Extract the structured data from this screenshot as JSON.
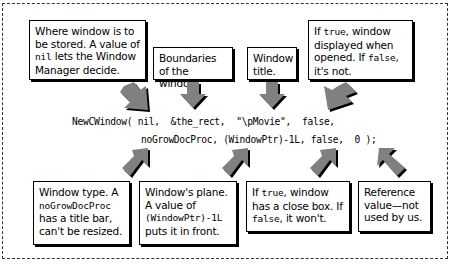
{
  "top_callouts": [
    {
      "id": "storage",
      "parts": [
        "Where window is to be stored. A value of ",
        "nil",
        " lets the Window Manager decide."
      ]
    },
    {
      "id": "bounds",
      "parts": [
        "Boundaries of the window."
      ]
    },
    {
      "id": "title",
      "parts": [
        "Window title."
      ]
    },
    {
      "id": "visible",
      "parts": [
        "If ",
        "true",
        ", window displayed when opened. If ",
        "false",
        ", it's not."
      ]
    }
  ],
  "code": {
    "line1": "NewCWindow( nil,  &the_rect,  \"\\pMovie\",  false,",
    "line2": "noGrowDocProc, (WindowPtr)-1L, false,  0 );"
  },
  "bottom_callouts": [
    {
      "id": "type",
      "parts": [
        "Window type. A ",
        "noGrowDocProc",
        " has a title bar, can't be resized."
      ]
    },
    {
      "id": "plane",
      "parts": [
        "Window's plane. A value of ",
        "(WindowPtr)-1L",
        " puts it in front."
      ]
    },
    {
      "id": "closebox",
      "parts": [
        "If ",
        "true",
        ", window has a close box. If ",
        "false",
        ", it won't."
      ]
    },
    {
      "id": "refcon",
      "parts": [
        "Reference value—not used by us."
      ]
    }
  ],
  "colors": {
    "arrow_fill": "#808080",
    "arrow_shadow": "#000000",
    "border": "#000000"
  }
}
